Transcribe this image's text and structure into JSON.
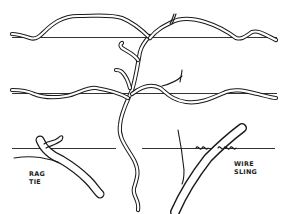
{
  "figure": {
    "wires": [
      {
        "name": "top-wire",
        "y": 37
      },
      {
        "name": "middle-wire",
        "y": 93
      },
      {
        "name": "bottom-wire",
        "y": 148
      }
    ],
    "labels": {
      "rag_tie": {
        "line1": "RAG",
        "line2": "TIE"
      },
      "wire_sling": {
        "line1": "WIRE",
        "line2": "SLING"
      }
    },
    "colors": {
      "ink": "#1a1a1a",
      "background": "#ffffff"
    }
  }
}
